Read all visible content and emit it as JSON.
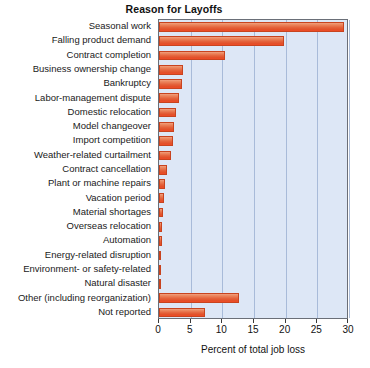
{
  "chart_data": {
    "type": "bar",
    "orientation": "horizontal",
    "title": "Reason for Layoffs",
    "xlabel": "Percent of total job loss",
    "ylabel": "",
    "xlim": [
      0,
      30
    ],
    "xticks": [
      0,
      5,
      10,
      15,
      20,
      25,
      30
    ],
    "xtick_labels": [
      "0",
      "5",
      "10",
      "15",
      "20",
      "25",
      "30"
    ],
    "grid": true,
    "legend": null,
    "plot_background": "#dde7f6",
    "bar_color": "#e4633c",
    "categories": [
      "Seasonal work",
      "Falling product demand",
      "Contract completion",
      "Business ownership change",
      "Bankruptcy",
      "Labor-management dispute",
      "Domestic relocation",
      "Model changeover",
      "Import competition",
      "Weather-related curtailment",
      "Contract cancellation",
      "Plant or machine repairs",
      "Vacation period",
      "Material shortages",
      "Overseas relocation",
      "Automation",
      "Energy-related disruption",
      "Environment- or safety-related",
      "Natural disaster",
      "Other (including reorganization)",
      "Not reported"
    ],
    "values": [
      29.2,
      19.8,
      10.4,
      3.8,
      3.6,
      3.2,
      2.7,
      2.4,
      2.2,
      1.9,
      1.3,
      0.9,
      0.8,
      0.7,
      0.5,
      0.4,
      0.3,
      0.3,
      0.2,
      12.7,
      7.3
    ]
  }
}
